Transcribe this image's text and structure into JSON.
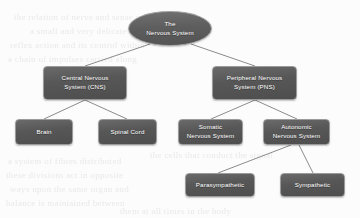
{
  "diagram": {
    "title": "The Nervous System",
    "type": "hierarchy-tree",
    "accent_color": "#575757",
    "node_border_color": "#9b9b9b",
    "node_text_color": "#ffffff",
    "edge_color": "#8b8b8b",
    "background_color": "#fcfcfc",
    "nodes": [
      {
        "id": "root",
        "label": "The\nNervous System",
        "line1": "The",
        "line2": "Nervous System",
        "shape": "ellipse",
        "level": 0,
        "x": 128,
        "y": 11,
        "w": 84,
        "h": 35
      },
      {
        "id": "cns",
        "label": "Central Nervous System (CNS)",
        "line1": "Central Nervous",
        "line2": "System (CNS)",
        "shape": "rounded-rect",
        "level": 1,
        "x": 43,
        "y": 66,
        "w": 84,
        "h": 34
      },
      {
        "id": "pns",
        "label": "Peripheral Nervous System (PNS)",
        "line1": "Peripheral Nervous",
        "line2": "System (PNS)",
        "shape": "rounded-rect",
        "level": 1,
        "x": 212,
        "y": 66,
        "w": 85,
        "h": 34
      },
      {
        "id": "brain",
        "label": "Brain",
        "line1": "Brain",
        "line2": "",
        "shape": "rounded-rect",
        "level": 2,
        "x": 15,
        "y": 119,
        "w": 58,
        "h": 26
      },
      {
        "id": "spinal-cord",
        "label": "Spinal Cord",
        "line1": "Spinal Cord",
        "line2": "",
        "shape": "rounded-rect",
        "level": 2,
        "x": 98,
        "y": 119,
        "w": 59,
        "h": 26
      },
      {
        "id": "somatic",
        "label": "Somatic Nervous System",
        "line1": "Somatic",
        "line2": "Nervous System",
        "shape": "rounded-rect",
        "level": 2,
        "x": 178,
        "y": 119,
        "w": 65,
        "h": 26
      },
      {
        "id": "autonomic",
        "label": "Autonomic Nervous System",
        "line1": "Autonomic",
        "line2": "Nervous System",
        "shape": "rounded-rect",
        "level": 2,
        "x": 263,
        "y": 119,
        "w": 67,
        "h": 26
      },
      {
        "id": "parasympathetic",
        "label": "Parasympathetic",
        "line1": "Parasympathetic",
        "line2": "",
        "shape": "rounded-rect",
        "level": 3,
        "x": 185,
        "y": 173,
        "w": 70,
        "h": 24
      },
      {
        "id": "sympathetic",
        "label": "Sympathetic",
        "line1": "Sympathetic",
        "line2": "",
        "shape": "rounded-rect",
        "level": 3,
        "x": 280,
        "y": 173,
        "w": 65,
        "h": 24
      }
    ],
    "edges": [
      {
        "id": "root-cns",
        "from": "root",
        "to": "cns",
        "x1": 150,
        "y1": 44,
        "x2": 85,
        "y2": 66
      },
      {
        "id": "root-pns",
        "from": "root",
        "to": "pns",
        "x1": 191,
        "y1": 44,
        "x2": 255,
        "y2": 66
      },
      {
        "id": "cns-brain",
        "from": "cns",
        "to": "brain",
        "x1": 85,
        "y1": 100,
        "x2": 44,
        "y2": 119
      },
      {
        "id": "cns-spinal-cord",
        "from": "cns",
        "to": "spinal-cord",
        "x1": 85,
        "y1": 100,
        "x2": 127,
        "y2": 119
      },
      {
        "id": "pns-somatic",
        "from": "pns",
        "to": "somatic",
        "x1": 255,
        "y1": 100,
        "x2": 211,
        "y2": 119
      },
      {
        "id": "pns-autonomic",
        "from": "pns",
        "to": "autonomic",
        "x1": 255,
        "y1": 100,
        "x2": 297,
        "y2": 119
      },
      {
        "id": "autonomic-parasympathetic",
        "from": "autonomic",
        "to": "parasympathetic",
        "x1": 291,
        "y1": 145,
        "x2": 218,
        "y2": 173
      },
      {
        "id": "autonomic-sympathetic",
        "from": "autonomic",
        "to": "sympathetic",
        "x1": 299,
        "y1": 145,
        "x2": 313,
        "y2": 173
      }
    ],
    "page_bleed_text": [
      {
        "text": "the relation of nerve and sense organ",
        "x": 14,
        "y": 12,
        "size": 9,
        "rot": 0
      },
      {
        "text": "a small and very delicate structure",
        "x": 30,
        "y": 26,
        "size": 9,
        "rot": 0
      },
      {
        "text": "reflex action and its control within",
        "x": 10,
        "y": 40,
        "size": 9,
        "rot": 0
      },
      {
        "text": "a chain of impulses carried along",
        "x": 8,
        "y": 54,
        "size": 9,
        "rot": 0
      },
      {
        "text": "the cells that conduct the signal",
        "x": 150,
        "y": 150,
        "size": 9,
        "rot": 0
      },
      {
        "text": "a system of fibres distributed",
        "x": 8,
        "y": 156,
        "size": 9,
        "rot": 0
      },
      {
        "text": "these divisions act in opposite",
        "x": 6,
        "y": 170,
        "size": 9,
        "rot": 0
      },
      {
        "text": "ways upon the same organ and",
        "x": 10,
        "y": 184,
        "size": 9,
        "rot": 0
      },
      {
        "text": "balance is maintained between",
        "x": 6,
        "y": 198,
        "size": 9,
        "rot": 0
      },
      {
        "text": "them at all times in the body",
        "x": 120,
        "y": 206,
        "size": 9,
        "rot": 0
      }
    ]
  }
}
